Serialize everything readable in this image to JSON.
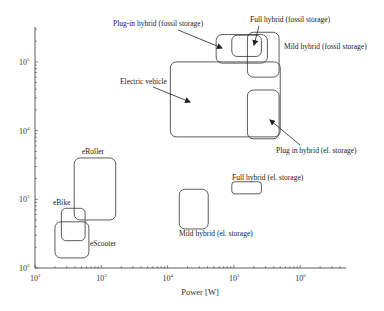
{
  "chart_data": {
    "type": "scatter",
    "subtype": "range-boxes",
    "title": "",
    "xlabel": "Power [W]",
    "ylabel": "",
    "xscale": "log",
    "yscale": "log",
    "xlim": [
      100,
      4000000
    ],
    "ylim": [
      100,
      350000
    ],
    "grid": false,
    "x_ticks": [
      {
        "value": 100,
        "base": "10",
        "exp": "2"
      },
      {
        "value": 1000,
        "base": "10",
        "exp": "3"
      },
      {
        "value": 10000,
        "base": "10",
        "exp": "4"
      },
      {
        "value": 100000,
        "base": "10",
        "exp": "5"
      },
      {
        "value": 1000000,
        "base": "10",
        "exp": "6"
      }
    ],
    "y_ticks": [
      {
        "value": 100,
        "base": "10",
        "exp": "2"
      },
      {
        "value": 1000,
        "base": "10",
        "exp": "3"
      },
      {
        "value": 10000,
        "base": "10",
        "exp": "4"
      },
      {
        "value": 100000,
        "base": "10",
        "exp": "5"
      }
    ],
    "regions": [
      {
        "name": "Electric vehicle",
        "x": [
          11000,
          500000
        ],
        "y": [
          8100,
          100000
        ]
      },
      {
        "name": "Plug-in hybrid (fossil storage)",
        "x": [
          54000,
          320000
        ],
        "y": [
          96000,
          250000
        ]
      },
      {
        "name": "Full hybrid (fossil storage)",
        "x": [
          93000,
          260000
        ],
        "y": [
          120000,
          245000
        ]
      },
      {
        "name": "Mild hybrid (fossil storage)",
        "x": [
          160000,
          480000
        ],
        "y": [
          60000,
          270000
        ]
      },
      {
        "name": "Plug in hybrid (el. storage)",
        "x": [
          160000,
          480000
        ],
        "y": [
          7600,
          39000
        ]
      },
      {
        "name": "Full hybrid (el. storage)",
        "x": [
          93000,
          260000
        ],
        "y": [
          1200,
          1800
        ]
      },
      {
        "name": "Mild hybrid (el. storage)",
        "x": [
          15000,
          41000
        ],
        "y": [
          370,
          1400
        ]
      },
      {
        "name": "eRoller",
        "x": [
          390,
          1650
        ],
        "y": [
          500,
          4000
        ]
      },
      {
        "name": "eBike",
        "x": [
          250,
          570
        ],
        "y": [
          250,
          740
        ]
      },
      {
        "name": "eScooter",
        "x": [
          200,
          650
        ],
        "y": [
          140,
          470
        ]
      }
    ],
    "annotations": [
      {
        "text": "Plug-in hybrid (fossil storage)",
        "arrow": true
      },
      {
        "text": "Full hybrid (fossil storage)",
        "arrow": true
      },
      {
        "text": "Mild hybrid (fossil storage)",
        "arrow": false
      },
      {
        "text": "Electric vehicle",
        "arrow": true
      },
      {
        "text": "Plug in hybrid (el. storage)",
        "arrow": true
      },
      {
        "text": "Full hybrid (el. storage)",
        "arrow": false
      },
      {
        "text": "Mild hybrid (el. storage)",
        "arrow": false
      },
      {
        "text": "eRoller",
        "arrow": false
      },
      {
        "text": "eBike",
        "arrow": false
      },
      {
        "text": "eScooter",
        "arrow": false
      }
    ]
  }
}
